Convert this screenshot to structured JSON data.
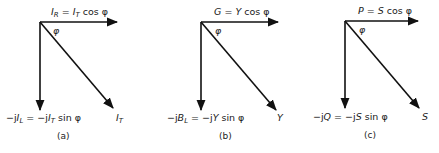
{
  "diagram": {
    "panels": [
      {
        "id": "a",
        "caption": "(a)",
        "angle_label": "φ",
        "horizontal": {
          "main": "I",
          "sub": "R",
          "eq": " = ",
          "rhs_main": "I",
          "rhs_sub": "T",
          "rhs_tail": " cos φ"
        },
        "vertical": {
          "lhs_pre": "−j",
          "lhs_main": "I",
          "lhs_sub": "L",
          "eq": " = ",
          "rhs_pre": "−j",
          "rhs_main": "I",
          "rhs_sub": "T",
          "rhs_tail": " sin φ"
        },
        "resultant": {
          "main": "I",
          "sub": "T"
        }
      },
      {
        "id": "b",
        "caption": "(b)",
        "angle_label": "φ",
        "horizontal": {
          "main": "G",
          "eq": " = ",
          "rhs_main": "Y",
          "rhs_tail": " cos φ"
        },
        "vertical": {
          "lhs_pre": "−j",
          "lhs_main": "B",
          "lhs_sub": "L",
          "eq": " = ",
          "rhs_pre": "−j",
          "rhs_main": "Y",
          "rhs_tail": " sin φ"
        },
        "resultant": {
          "main": "Y"
        }
      },
      {
        "id": "c",
        "caption": "(c)",
        "angle_label": "φ",
        "horizontal": {
          "main": "P",
          "eq": " = ",
          "rhs_main": "S",
          "rhs_tail": " cos φ"
        },
        "vertical": {
          "lhs_pre": "−j",
          "lhs_main": "Q",
          "eq": " = ",
          "rhs_pre": "−j",
          "rhs_main": "S",
          "rhs_tail": " sin φ"
        },
        "resultant": {
          "main": "S"
        }
      }
    ]
  }
}
